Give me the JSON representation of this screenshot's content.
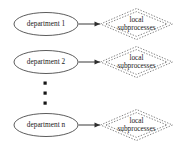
{
  "diagram": {
    "type": "entity-relationship-fragment",
    "background_color": "#ffffff",
    "rows": [
      {
        "id": "row-1",
        "entity_label": "department 1",
        "relation_label_line1": "local",
        "relation_label_line2": "subprocesses",
        "arrow_direction": "right"
      },
      {
        "id": "row-2",
        "entity_label": "department 2",
        "relation_label_line1": "local",
        "relation_label_line2": "subprocesses",
        "arrow_direction": "right"
      },
      {
        "id": "row-3",
        "entity_label": "department n",
        "relation_label_line1": "local",
        "relation_label_line2": "subprocesses",
        "arrow_direction": "right"
      }
    ],
    "ellipsis": {
      "dot_count": 3,
      "orientation": "vertical"
    },
    "colors": {
      "entity_stroke": "#4a4a4a",
      "relation_stroke": "#6e6e6e",
      "arrow_stroke": "#2e2e2e",
      "text": "#1a1a1a"
    }
  }
}
